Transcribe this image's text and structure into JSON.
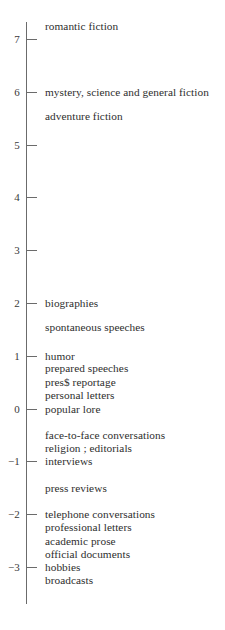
{
  "chart_data": {
    "type": "scatter",
    "title": "",
    "subtitle": "",
    "xlabel": "",
    "ylabel": "",
    "orientation": "vertical-axis-only",
    "grid": false,
    "legend": "none",
    "ylim": [
      -3.6,
      7.6
    ],
    "axis": {
      "ticks": [
        {
          "value": 7,
          "label": "7"
        },
        {
          "value": 6,
          "label": "6"
        },
        {
          "value": 5,
          "label": "5"
        },
        {
          "value": 4,
          "label": "4"
        },
        {
          "value": 3,
          "label": "3"
        },
        {
          "value": 2,
          "label": "2"
        },
        {
          "value": 1,
          "label": "1"
        },
        {
          "value": 0,
          "label": "0"
        },
        {
          "value": -1,
          "label": "−1"
        },
        {
          "value": -2,
          "label": "−2"
        },
        {
          "value": -3,
          "label": "−3"
        }
      ],
      "line_color": "#6b6b6b",
      "text_color": "#3a3a3a"
    },
    "points": [
      {
        "label": "romantic fiction",
        "value": 7.25
      },
      {
        "label": "mystery, science and general fiction",
        "value": 6.0
      },
      {
        "label": "adventure fiction",
        "value": 5.55
      },
      {
        "label": "biographies",
        "value": 2.0
      },
      {
        "label": "spontaneous speeches",
        "value": 1.55
      },
      {
        "label": "humor",
        "value": 1.0
      },
      {
        "label": "prepared speeches",
        "value": 0.76
      },
      {
        "label": "pres$ reportage",
        "value": 0.51
      },
      {
        "label": "personal letters",
        "value": 0.26
      },
      {
        "label": "popular lore",
        "value": 0.0
      },
      {
        "label": "face-to-face conversations",
        "value": -0.5
      },
      {
        "label": "religion ; editorials",
        "value": -0.75
      },
      {
        "label": "interviews",
        "value": -1.0
      },
      {
        "label": "press reviews",
        "value": -1.5
      },
      {
        "label": "telephone conversations",
        "value": -2.0
      },
      {
        "label": "professional letters",
        "value": -2.25
      },
      {
        "label": "academic prose",
        "value": -2.5
      },
      {
        "label": "official documents",
        "value": -2.75
      },
      {
        "label": "hobbies",
        "value": -3.0
      },
      {
        "label": "broadcasts",
        "value": -3.25
      }
    ]
  }
}
